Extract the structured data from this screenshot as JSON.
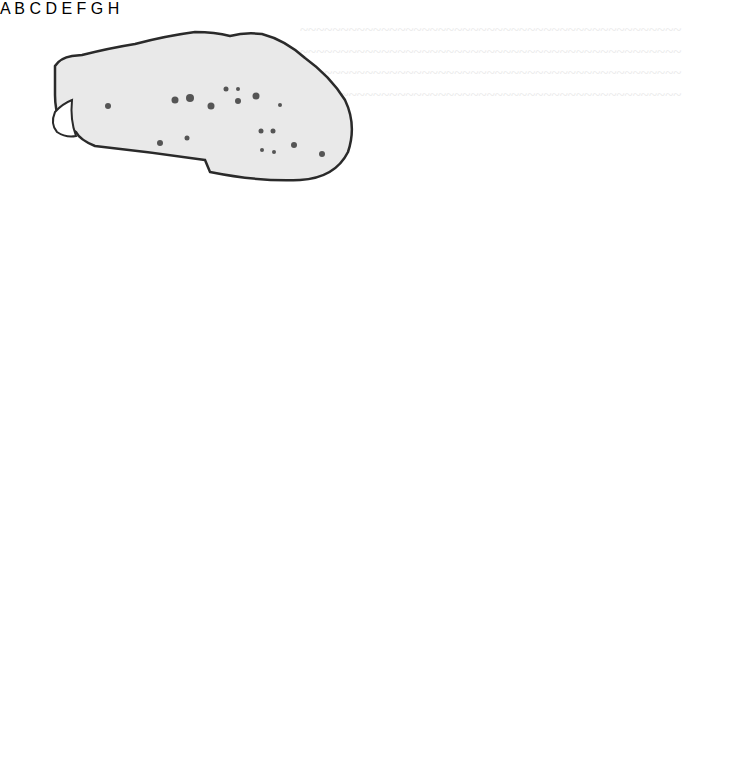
{
  "figure": {
    "panels": [
      {
        "label": "A",
        "description": "photograph of spotted oblong specimen with outline and white end cap"
      },
      {
        "label": "B",
        "description": "line drawing of oval body with many radiating tentacle-like filaments"
      },
      {
        "label": "C",
        "description": "photograph of mottled elongated rough specimen"
      },
      {
        "label": "D",
        "description": "photograph of specimen with dense dotted surface texture"
      },
      {
        "label": "E",
        "description": "outline drawing of lens-shaped form with zig-zag seam, opened"
      },
      {
        "label": "F",
        "description": "outline drawing of lens-shaped form with dark filled slit"
      },
      {
        "label": "G",
        "description": "side outline with two small rectangular projections and arrows, tail at lower left"
      },
      {
        "label": "H",
        "description": "side outline with two small rectangular projections and arrows, tail at right"
      }
    ],
    "colors": {
      "background": "#ffffff",
      "line": "#3a3a3a",
      "label": "#2a2a2a",
      "fill_light": "#ececec",
      "fill_dark": "#1a1a1a"
    }
  }
}
